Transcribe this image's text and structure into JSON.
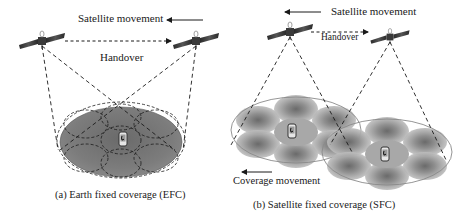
{
  "panel_a": {
    "satellite_movement_label": "Satellite movement",
    "handover_label": "Handover",
    "caption": "(a) Earth fixed coverage (EFC)",
    "coverage_type": "Earth fixed coverage",
    "satellites": 2,
    "icons": [
      "satellite-icon",
      "satellite-icon",
      "mobile-phone-icon"
    ]
  },
  "panel_b": {
    "satellite_movement_label": "Satellite movement",
    "handover_label": "Handover",
    "coverage_movement_label": "Coverage movement",
    "caption": "(b) Satellite fixed coverage (SFC)",
    "coverage_type": "Satellite fixed coverage",
    "satellites": 2,
    "cells_per_footprint": 7,
    "icons": [
      "satellite-icon",
      "satellite-icon",
      "mobile-phone-icon",
      "mobile-phone-icon"
    ]
  },
  "colors": {
    "ground_fill": "#7a7a7a",
    "cell_dark": "#6e6e6e",
    "cell_light": "#b5b5b5",
    "line": "#1a1a1a",
    "background": "#ffffff"
  }
}
